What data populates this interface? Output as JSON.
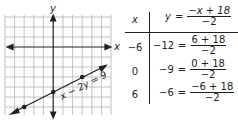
{
  "graph": {
    "x_axis_label": "x",
    "y_axis_label": "y",
    "line_label": "x − 2y = 9",
    "grid_range": {
      "x": [
        -9,
        9
      ],
      "y": [
        -9,
        9
      ]
    },
    "grid_step": 1.5,
    "points": [
      {
        "x": -6,
        "y": -12
      },
      {
        "x": 0,
        "y": -9
      },
      {
        "x": 6,
        "y": -6
      }
    ],
    "colors": {
      "grid": "#b5b3b4",
      "axis": "#231f20",
      "line": "#231f20"
    }
  },
  "table": {
    "header": {
      "x": "x",
      "y_lhs": "y",
      "eq": "=",
      "num": "−x + 18",
      "den": "−2"
    },
    "rows": [
      {
        "x": "−6",
        "y": "−12",
        "eq": "=",
        "num": "6 + 18",
        "den": "−2"
      },
      {
        "x": "0",
        "y": "−9",
        "eq": "=",
        "num": "0 + 18",
        "den": "−2"
      },
      {
        "x": "6",
        "y": "−6",
        "eq": "=",
        "num": "−6 + 18",
        "den": "−2"
      }
    ]
  }
}
